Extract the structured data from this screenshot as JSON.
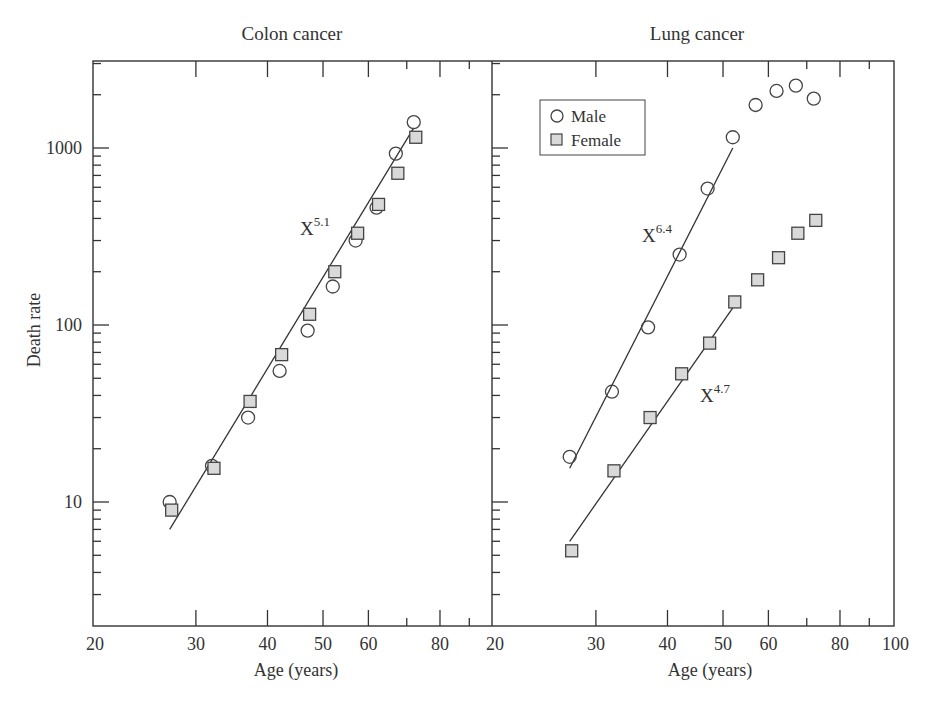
{
  "figure": {
    "ylabel": "Death rate",
    "xlabel": "Age (years)",
    "legend": [
      {
        "label": "Male",
        "marker": "open-circle"
      },
      {
        "label": "Female",
        "marker": "gray-square"
      }
    ],
    "colors": {
      "axis": "#333333",
      "marker_fill_female": "#d9d9d9",
      "marker_stroke": "#444444"
    }
  },
  "chart_data": [
    {
      "type": "scatter",
      "title": "Colon cancer",
      "xlabel": "Age (years)",
      "ylabel": "Death rate",
      "xscale": "log",
      "yscale": "log",
      "xlim": [
        20,
        100
      ],
      "ylim": [
        2.5,
        3000
      ],
      "xticks": [
        20,
        30,
        40,
        50,
        60,
        80
      ],
      "yticks": [
        10,
        100,
        1000
      ],
      "series": [
        {
          "name": "Male",
          "marker": "circle",
          "x": [
            27,
            32,
            37,
            42,
            47,
            52,
            57,
            62,
            67,
            72
          ],
          "y": [
            10,
            16,
            30,
            55,
            93,
            165,
            300,
            460,
            930,
            1400
          ]
        },
        {
          "name": "Female",
          "marker": "square",
          "x": [
            27,
            32,
            37,
            42,
            47,
            52,
            57,
            62,
            67,
            72
          ],
          "y": [
            9,
            15.5,
            37,
            68,
            115,
            200,
            330,
            480,
            720,
            1150
          ]
        }
      ],
      "fits": [
        {
          "label": "X^5.1",
          "exponent": 5.1,
          "x_range": [
            27,
            72
          ],
          "y_range": [
            7,
            1300
          ]
        }
      ],
      "annotations": [
        {
          "text": "X",
          "sup": "5.1"
        }
      ]
    },
    {
      "type": "scatter",
      "title": "Lung cancer",
      "xlabel": "Age (years)",
      "xscale": "log",
      "yscale": "log",
      "xlim": [
        20,
        100
      ],
      "ylim": [
        2.5,
        3000
      ],
      "xticks": [
        20,
        30,
        40,
        50,
        60,
        80,
        100
      ],
      "legend_position": "upper left",
      "series": [
        {
          "name": "Male",
          "marker": "circle",
          "x": [
            27,
            32,
            37,
            42,
            47,
            52,
            57,
            62,
            67,
            72
          ],
          "y": [
            18,
            42,
            97,
            250,
            590,
            1150,
            1750,
            2100,
            2250,
            1900
          ]
        },
        {
          "name": "Female",
          "marker": "square",
          "x": [
            27,
            32,
            37,
            42,
            47,
            52,
            57,
            62,
            67,
            72
          ],
          "y": [
            5.3,
            15,
            30,
            53,
            79,
            135,
            180,
            240,
            330,
            390
          ]
        }
      ],
      "fits": [
        {
          "label": "X^6.4",
          "exponent": 6.4,
          "series": "Male",
          "x_range": [
            27,
            52
          ],
          "y_range": [
            15.5,
            1000
          ]
        },
        {
          "label": "X^4.7",
          "exponent": 4.7,
          "series": "Female",
          "x_range": [
            27,
            52
          ],
          "y_range": [
            6,
            125
          ]
        }
      ],
      "annotations": [
        {
          "text": "X",
          "sup": "6.4"
        },
        {
          "text": "X",
          "sup": "4.7"
        }
      ]
    }
  ],
  "labels": {
    "colon_title": "Colon cancer",
    "lung_title": "Lung cancer",
    "fit_colon": {
      "base": "X",
      "sup": "5.1"
    },
    "fit_lung_male": {
      "base": "X",
      "sup": "6.4"
    },
    "fit_lung_female": {
      "base": "X",
      "sup": "4.7"
    },
    "yticks": [
      "1000",
      "100",
      "10"
    ],
    "xticks_left": [
      "20",
      "30",
      "40",
      "50",
      "60",
      "80"
    ],
    "xticks_right": [
      "20",
      "30",
      "40",
      "50",
      "60",
      "80",
      "100"
    ]
  }
}
